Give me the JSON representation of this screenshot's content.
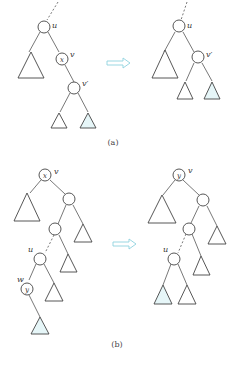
{
  "figure": {
    "part_a": {
      "caption": "(a)",
      "before": {
        "labels": {
          "u": "u",
          "v": "v",
          "x": "x",
          "v_prime": "v′"
        }
      },
      "after": {
        "labels": {
          "u": "u",
          "v_prime": "v′"
        }
      }
    },
    "part_b": {
      "caption": "(b)",
      "before": {
        "labels": {
          "x": "x",
          "v": "v",
          "u": "u",
          "w": "w",
          "y": "y"
        }
      },
      "after": {
        "labels": {
          "y": "y",
          "v": "v",
          "u": "u"
        }
      }
    },
    "colors": {
      "arrow": "#8fd3df",
      "highlight_subtree": "#e6f6f8",
      "line": "#444444"
    }
  }
}
